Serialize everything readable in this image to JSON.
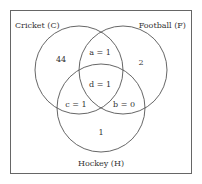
{
  "diagram": {
    "type": "venn",
    "sets": [
      {
        "id": "C",
        "label": "Cricket (C)"
      },
      {
        "id": "F",
        "label": "Football (F)"
      },
      {
        "id": "H",
        "label": "Hockey (H)"
      }
    ],
    "regions": {
      "c_only": "44",
      "f_only": "2",
      "h_only": "1",
      "c_and_f_only": "a = 1",
      "f_and_h_only": "b = 0",
      "c_and_h_only": "c = 1",
      "all_three": "d = 1"
    },
    "colors": {
      "stroke": "#555555",
      "text": "#333333",
      "background": "#ffffff"
    }
  }
}
